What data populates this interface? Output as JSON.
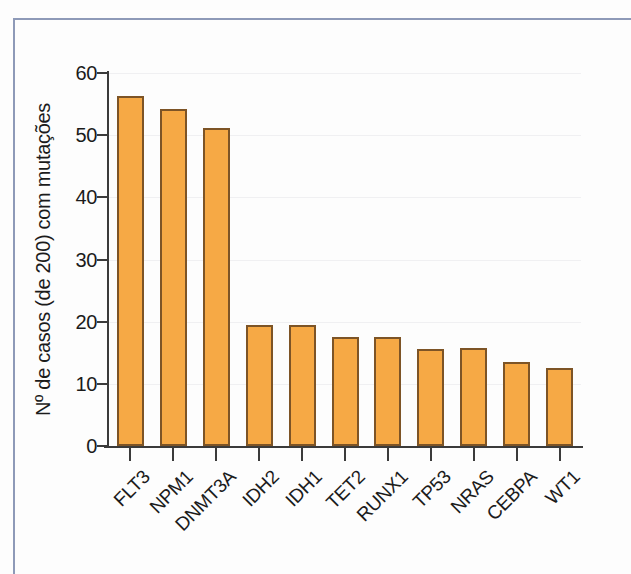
{
  "figure": {
    "frame_color": "#8e9ab8",
    "background_color": "#fdfdfd"
  },
  "chart_data": {
    "type": "bar",
    "title": "",
    "xlabel": "",
    "ylabel": "Nº de casos (de 200) com mutações",
    "categories": [
      "FLT3",
      "NPM1",
      "DNMT3A",
      "IDH2",
      "IDH1",
      "TET2",
      "RUNX1",
      "TP53",
      "NRAS",
      "CEBPA",
      "WT1"
    ],
    "values": [
      56.3,
      54.2,
      51.2,
      19.5,
      19.5,
      17.5,
      17.5,
      15.6,
      15.7,
      13.5,
      12.5
    ],
    "ylim": [
      0,
      60
    ],
    "yticks": [
      0,
      10,
      20,
      30,
      40,
      50,
      60
    ],
    "ytick_labels": [
      "0",
      "10",
      "20",
      "30",
      "40",
      "50",
      "60"
    ],
    "grid": "faint-horizontal",
    "legend": "none",
    "bar_fill_color": "#f6a945",
    "bar_edge_color": "#7d5426",
    "axis_color": "#3b3b3b",
    "xtick_label_rotation": -45
  }
}
